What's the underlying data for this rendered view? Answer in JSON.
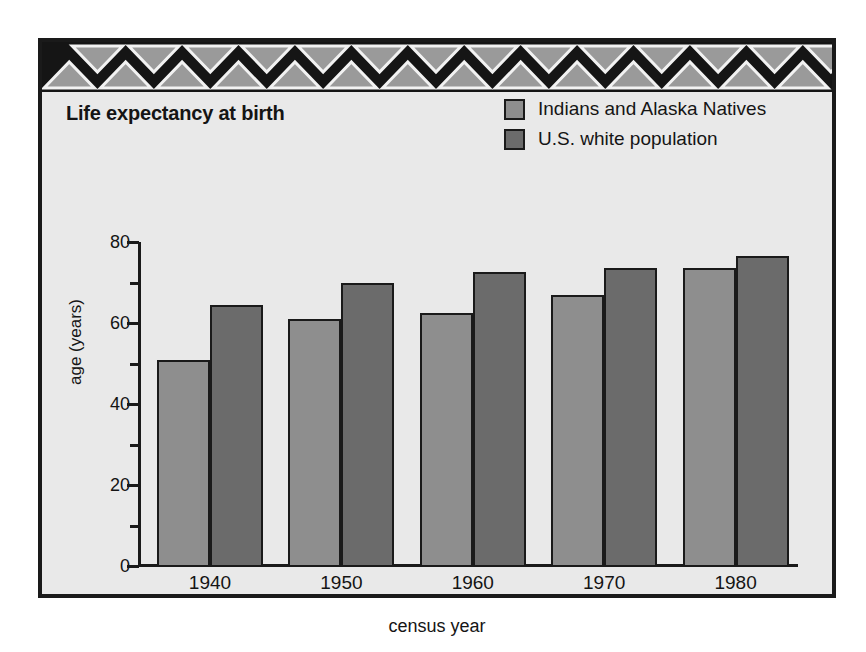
{
  "figure": {
    "title": "Life expectancy at birth",
    "background_color": "#e9e9e9",
    "frame_color": "#1a1a1a",
    "banner": {
      "name": "triangle-border-pattern",
      "background_color": "#151515",
      "triangle_fill": "#9a9a9a",
      "triangle_outline": "#f2f2f2",
      "repeat_count": 14
    }
  },
  "legend": {
    "position": "top-right",
    "items": [
      {
        "label": "Indians and Alaska Natives",
        "color": "#8e8e8e"
      },
      {
        "label": "U.S. white population",
        "color": "#6b6b6b"
      }
    ]
  },
  "chart_data": {
    "type": "bar",
    "title": "Life expectancy at birth",
    "xlabel": "census year",
    "ylabel": "age (years)",
    "categories": [
      "1940",
      "1950",
      "1960",
      "1970",
      "1980"
    ],
    "series": [
      {
        "name": "Indians and Alaska Natives",
        "color": "#8e8e8e",
        "values": [
          51,
          61,
          62.5,
          67,
          73.5
        ]
      },
      {
        "name": "U.S. white population",
        "color": "#6b6b6b",
        "values": [
          64.5,
          70,
          72.5,
          73.5,
          76.5
        ]
      }
    ],
    "ylim": [
      0,
      80
    ],
    "ytick_major": [
      0,
      20,
      40,
      60,
      80
    ],
    "ytick_minor": [
      10,
      30,
      50,
      70
    ],
    "grid": false,
    "legend_position": "top-right"
  }
}
